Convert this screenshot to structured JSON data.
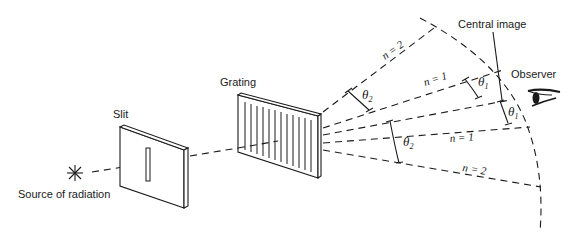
{
  "diagram": {
    "labels": {
      "source": "Source of radiation",
      "slit": "Slit",
      "grating": "Grating",
      "central_image": "Central image",
      "observer": "Observer"
    },
    "orders": {
      "upper_n2": "n = 2",
      "upper_n1": "n = 1",
      "lower_n1": "n = 1",
      "lower_n2": "n = 2"
    },
    "angles": {
      "theta": "θ",
      "upper_theta2_sub": "2",
      "upper_theta1_sub": "1",
      "lower_theta1_sub": "1",
      "lower_theta2_sub": "2"
    },
    "icons": {
      "source": "star-burst-icon",
      "observer": "eye-icon"
    }
  }
}
